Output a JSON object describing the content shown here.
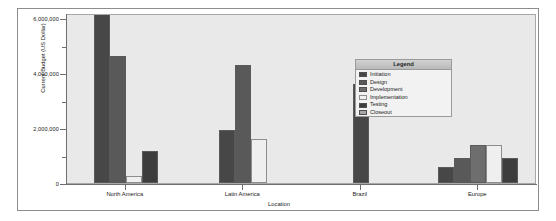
{
  "chart_data": {
    "type": "bar",
    "title": "",
    "xlabel": "Location",
    "ylabel": "Current Budget (US Dollar)",
    "categories": [
      "North America",
      "Latin America",
      "Brazil",
      "Europe"
    ],
    "ylim": [
      0,
      6200000
    ],
    "yticks": [
      0,
      2000000,
      4000000,
      6000000
    ],
    "ytick_labels": [
      "0",
      "2,000,000",
      "4,000,000",
      "6,000,000"
    ],
    "grid": false,
    "legend_position": "inside-upper-right",
    "legend_title": "Legend",
    "series": [
      {
        "name": "Initiation",
        "color": "#474747",
        "values": [
          6250000,
          1950000,
          3600000,
          600000
        ]
      },
      {
        "name": "Design",
        "color": "#595959",
        "values": [
          4650000,
          4300000,
          null,
          900000
        ]
      },
      {
        "name": "Development",
        "color": "#6e6e6e",
        "values": [
          null,
          null,
          null,
          1400000
        ]
      },
      {
        "name": "Implementation",
        "color": "#efefef",
        "values": [
          270000,
          1600000,
          null,
          1400000
        ]
      },
      {
        "name": "Testing",
        "color": "#3d3d3d",
        "values": [
          1150000,
          null,
          null,
          900000
        ]
      },
      {
        "name": "Closeout",
        "color": "#a8a8a8",
        "values": [
          null,
          null,
          null,
          null
        ]
      }
    ]
  },
  "legend": {
    "title": "Legend",
    "items": [
      {
        "label": "Initiation",
        "color": "#474747"
      },
      {
        "label": "Design",
        "color": "#595959"
      },
      {
        "label": "Development",
        "color": "#6e6e6e"
      },
      {
        "label": "Implementation",
        "color": "#efefef"
      },
      {
        "label": "Testing",
        "color": "#3d3d3d"
      },
      {
        "label": "Closeout",
        "color": "#a8a8a8"
      }
    ]
  },
  "axes": {
    "y_title": "Current Budget (US Dollar)",
    "x_title": "Location",
    "y_tick_labels": [
      "6,000,000",
      "4,000,000",
      "2,000,000",
      "0"
    ],
    "x_tick_labels": [
      "North America",
      "Latin America",
      "Brazil",
      "Europe"
    ]
  },
  "style": {
    "plot_background": "#e9e9e9",
    "frame_border": "#8d8d8d",
    "axis_color": "#6f6f6f",
    "text_color": "#1a1a1a"
  }
}
